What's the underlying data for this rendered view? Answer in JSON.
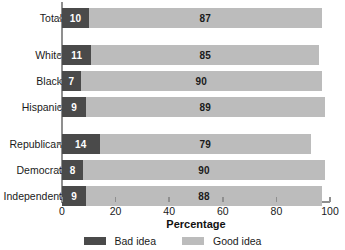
{
  "chart_data": {
    "type": "bar",
    "orientation": "horizontal",
    "stacked": true,
    "title": "",
    "xlabel": "Percentage",
    "ylabel": "",
    "xlim": [
      0,
      100
    ],
    "xticks": [
      0,
      20,
      40,
      60,
      80,
      100
    ],
    "grid": false,
    "legend_position": "bottom",
    "categories": [
      "Total",
      "White",
      "Black",
      "Hispanic",
      "Republican",
      "Democrat",
      "Independent"
    ],
    "group_breaks_after": [
      "Total",
      "Hispanic"
    ],
    "series": [
      {
        "name": "Bad idea",
        "color": "#4a4a4a",
        "values": [
          10,
          11,
          7,
          9,
          14,
          8,
          9
        ]
      },
      {
        "name": "Good idea",
        "color": "#bcbcbc",
        "values": [
          87,
          85,
          90,
          89,
          79,
          90,
          88
        ]
      }
    ]
  },
  "axis": {
    "x_title": "Percentage",
    "tick_labels": [
      "0",
      "20",
      "40",
      "60",
      "80",
      "100"
    ]
  },
  "legend": {
    "items": [
      {
        "label": "Bad idea",
        "color": "#4a4a4a"
      },
      {
        "label": "Good idea",
        "color": "#bcbcbc"
      }
    ]
  },
  "colors": {
    "bad_idea": "#4a4a4a",
    "good_idea": "#bcbcbc",
    "axis": "#8f8f8f",
    "text": "#1a1a1a",
    "background": "#ffffff"
  }
}
